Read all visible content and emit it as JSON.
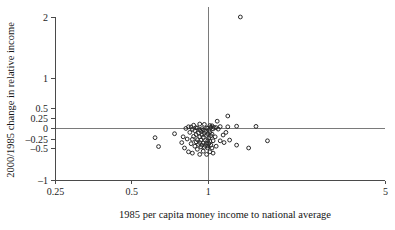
{
  "chart_data": {
    "type": "scatter",
    "title": "",
    "xlabel": "1985 per capita money income to national average",
    "ylabel": "2000/1985 change in relative income",
    "xscale": "log",
    "yscale": "symlog",
    "xlim": [
      0.25,
      5
    ],
    "ylim": [
      -1,
      2
    ],
    "grid": false,
    "legend": null,
    "xticks": [
      0.25,
      0.5,
      1,
      5
    ],
    "xtick_labels": [
      "0.25",
      "0.5",
      "1",
      "5"
    ],
    "yticks": [
      2,
      1,
      0.5,
      0.25,
      0,
      -0.25,
      -0.5,
      -1
    ],
    "ytick_labels": [
      "2",
      "1",
      "0.5",
      "0.25",
      "0",
      "–0.25",
      "–0.5",
      "–1"
    ],
    "reference_lines": [
      {
        "orientation": "horizontal",
        "value": 0
      },
      {
        "orientation": "vertical",
        "value": 1
      }
    ],
    "marker": "open-circle",
    "marker_color": "#2a2a2a",
    "points": [
      {
        "x": 1.345,
        "y": 2.0
      },
      {
        "x": 1.2,
        "y": 0.3
      },
      {
        "x": 1.09,
        "y": 0.17
      },
      {
        "x": 0.93,
        "y": 0.1
      },
      {
        "x": 0.97,
        "y": 0.09
      },
      {
        "x": 0.88,
        "y": 0.07
      },
      {
        "x": 1.02,
        "y": 0.06
      },
      {
        "x": 1.04,
        "y": 0.055
      },
      {
        "x": 1.3,
        "y": 0.045
      },
      {
        "x": 1.55,
        "y": 0.04
      },
      {
        "x": 1.12,
        "y": 0.035
      },
      {
        "x": 1.2,
        "y": 0.03
      },
      {
        "x": 0.84,
        "y": 0.03
      },
      {
        "x": 0.86,
        "y": 0.025
      },
      {
        "x": 1.03,
        "y": 0.02
      },
      {
        "x": 1.06,
        "y": 0.015
      },
      {
        "x": 1.08,
        "y": 0.01
      },
      {
        "x": 0.9,
        "y": 0.005
      },
      {
        "x": 0.91,
        "y": 0.0
      },
      {
        "x": 0.99,
        "y": 0.0
      },
      {
        "x": 1.0,
        "y": -0.005
      },
      {
        "x": 0.82,
        "y": -0.01
      },
      {
        "x": 0.95,
        "y": -0.015
      },
      {
        "x": 1.05,
        "y": -0.02
      },
      {
        "x": 1.1,
        "y": -0.025
      },
      {
        "x": 0.87,
        "y": -0.03
      },
      {
        "x": 0.93,
        "y": -0.04
      },
      {
        "x": 0.96,
        "y": -0.05
      },
      {
        "x": 1.01,
        "y": -0.055
      },
      {
        "x": 0.89,
        "y": -0.06
      },
      {
        "x": 0.94,
        "y": -0.07
      },
      {
        "x": 0.98,
        "y": -0.08
      },
      {
        "x": 1.02,
        "y": -0.09
      },
      {
        "x": 0.85,
        "y": -0.1
      },
      {
        "x": 0.92,
        "y": -0.11
      },
      {
        "x": 0.97,
        "y": -0.12
      },
      {
        "x": 1.0,
        "y": -0.13
      },
      {
        "x": 1.04,
        "y": -0.14
      },
      {
        "x": 0.9,
        "y": -0.15
      },
      {
        "x": 0.95,
        "y": -0.16
      },
      {
        "x": 0.99,
        "y": -0.17
      },
      {
        "x": 1.03,
        "y": -0.18
      },
      {
        "x": 0.88,
        "y": -0.19
      },
      {
        "x": 0.93,
        "y": -0.2
      },
      {
        "x": 0.96,
        "y": -0.21
      },
      {
        "x": 1.01,
        "y": -0.22
      },
      {
        "x": 1.07,
        "y": -0.2
      },
      {
        "x": 1.15,
        "y": -0.16
      },
      {
        "x": 1.18,
        "y": -0.1
      },
      {
        "x": 0.8,
        "y": -0.2
      },
      {
        "x": 0.83,
        "y": -0.25
      },
      {
        "x": 0.87,
        "y": -0.26
      },
      {
        "x": 0.91,
        "y": -0.27
      },
      {
        "x": 0.94,
        "y": -0.28
      },
      {
        "x": 0.98,
        "y": -0.29
      },
      {
        "x": 1.0,
        "y": -0.3
      },
      {
        "x": 1.02,
        "y": -0.31
      },
      {
        "x": 1.05,
        "y": -0.3
      },
      {
        "x": 0.9,
        "y": -0.33
      },
      {
        "x": 0.93,
        "y": -0.35
      },
      {
        "x": 0.96,
        "y": -0.36
      },
      {
        "x": 0.99,
        "y": -0.37
      },
      {
        "x": 1.01,
        "y": -0.38
      },
      {
        "x": 0.86,
        "y": -0.38
      },
      {
        "x": 0.92,
        "y": -0.4
      },
      {
        "x": 0.95,
        "y": -0.42
      },
      {
        "x": 0.98,
        "y": -0.43
      },
      {
        "x": 1.0,
        "y": -0.44
      },
      {
        "x": 1.03,
        "y": -0.42
      },
      {
        "x": 0.89,
        "y": -0.45
      },
      {
        "x": 0.94,
        "y": -0.47
      },
      {
        "x": 0.97,
        "y": -0.48
      },
      {
        "x": 1.0,
        "y": -0.5
      },
      {
        "x": 1.04,
        "y": -0.5
      },
      {
        "x": 0.91,
        "y": -0.52
      },
      {
        "x": 0.96,
        "y": -0.55
      },
      {
        "x": 1.02,
        "y": -0.56
      },
      {
        "x": 1.08,
        "y": -0.45
      },
      {
        "x": 1.12,
        "y": -0.3
      },
      {
        "x": 1.16,
        "y": -0.35
      },
      {
        "x": 1.22,
        "y": -0.28
      },
      {
        "x": 1.3,
        "y": -0.42
      },
      {
        "x": 1.45,
        "y": -0.5
      },
      {
        "x": 1.72,
        "y": -0.3
      },
      {
        "x": 0.74,
        "y": -0.13
      },
      {
        "x": 0.62,
        "y": -0.22
      },
      {
        "x": 0.64,
        "y": -0.46
      },
      {
        "x": 0.79,
        "y": -0.35
      },
      {
        "x": 0.81,
        "y": -0.5
      },
      {
        "x": 0.84,
        "y": -0.56
      },
      {
        "x": 0.87,
        "y": -0.58
      },
      {
        "x": 0.93,
        "y": -0.6
      },
      {
        "x": 0.99,
        "y": -0.6
      },
      {
        "x": 1.05,
        "y": -0.58
      }
    ]
  }
}
